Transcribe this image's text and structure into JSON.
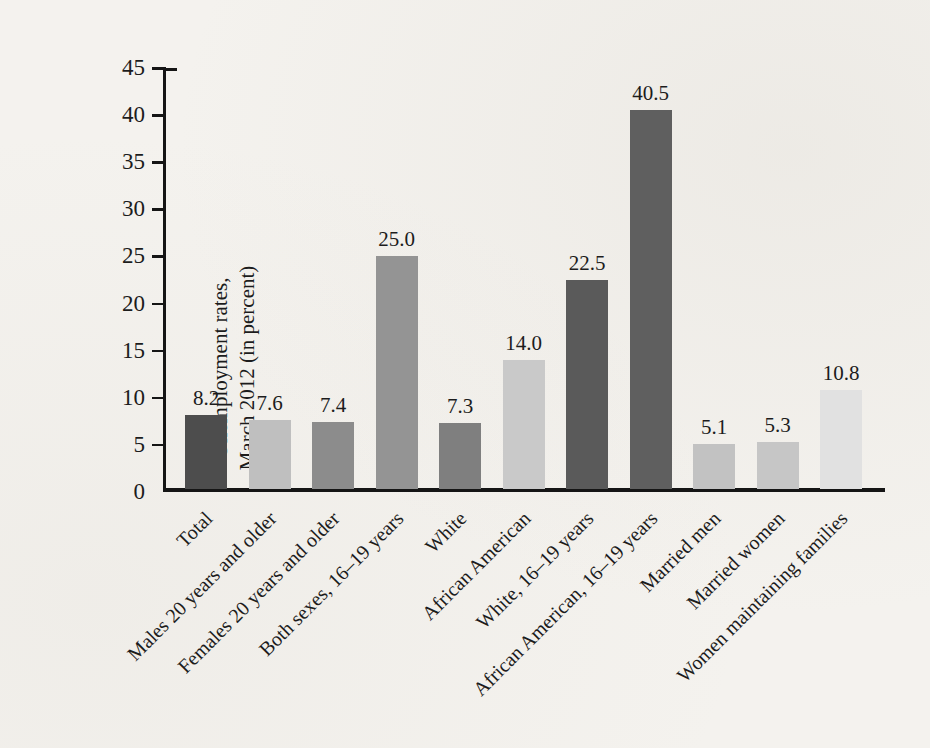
{
  "chart_data": {
    "type": "bar",
    "title": "",
    "ylabel_line1": "Unemployment rates,",
    "ylabel_line2": "March 2012 (in percent)",
    "ylim": [
      0,
      45
    ],
    "yticks": [
      0,
      5,
      10,
      15,
      20,
      25,
      30,
      35,
      40,
      45
    ],
    "grid": false,
    "legend": "none",
    "categories": [
      "Total",
      "Males 20 years and older",
      "Females 20 years and older",
      "Both sexes, 16–19 years",
      "White",
      "African American",
      "White, 16–19 years",
      "African American, 16–19 years",
      "Married men",
      "Married women",
      "Women maintaining families"
    ],
    "values": [
      8.2,
      7.6,
      7.4,
      25.0,
      7.3,
      14.0,
      22.5,
      40.5,
      5.1,
      5.3,
      10.8
    ],
    "value_labels": [
      "8.2",
      "7.6",
      "7.4",
      "25.0",
      "7.3",
      "14.0",
      "22.5",
      "40.5",
      "5.1",
      "5.3",
      "10.8"
    ],
    "bar_colors": [
      "#4d4d4d",
      "#bfbfbf",
      "#8c8c8c",
      "#949494",
      "#7f7f7f",
      "#c9c9c9",
      "#5a5a5a",
      "#5f5f5f",
      "#c2c2c2",
      "#c6c6c6",
      "#e1e1e1"
    ],
    "axis_color": "#151515",
    "text_color": "#1c1c1c",
    "page_background": "#f4f2ee"
  }
}
